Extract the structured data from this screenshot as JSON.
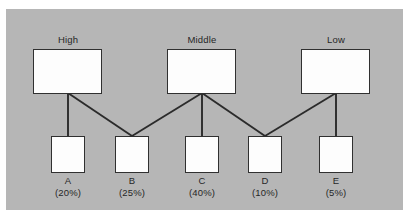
{
  "diagram": {
    "type": "hierarchy-tree",
    "background_color": "#b6b6b6",
    "box_fill_color": "#fdfdfd",
    "box_border_color": "#303030",
    "connector_color": "#2b2b2b",
    "parents": [
      {
        "id": "high",
        "title": "High"
      },
      {
        "id": "middle",
        "title": "Middle"
      },
      {
        "id": "low",
        "title": "Low"
      }
    ],
    "children": [
      {
        "id": "a",
        "name": "A",
        "percent_label": "(20%)",
        "percent_value": 20
      },
      {
        "id": "b",
        "name": "B",
        "percent_label": "(25%)",
        "percent_value": 25
      },
      {
        "id": "c",
        "name": "C",
        "percent_label": "(40%)",
        "percent_value": 40
      },
      {
        "id": "d",
        "name": "D",
        "percent_label": "(10%)",
        "percent_value": 10
      },
      {
        "id": "e",
        "name": "E",
        "percent_label": "(5%)",
        "percent_value": 5
      }
    ],
    "links": [
      {
        "from": "high",
        "to": "a"
      },
      {
        "from": "high",
        "to": "b"
      },
      {
        "from": "middle",
        "to": "b"
      },
      {
        "from": "middle",
        "to": "c"
      },
      {
        "from": "middle",
        "to": "d"
      },
      {
        "from": "low",
        "to": "d"
      },
      {
        "from": "low",
        "to": "e"
      }
    ]
  }
}
